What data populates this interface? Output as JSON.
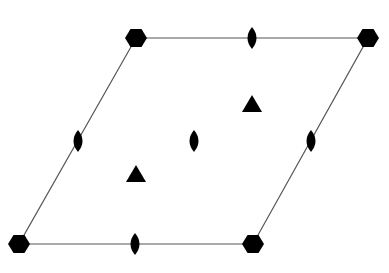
{
  "diagram": {
    "colors": {
      "background": "#ffffff",
      "edge": "#555555",
      "symbol": "#000000"
    },
    "cell": {
      "vertices": [
        [
          136,
          38
        ],
        [
          368,
          38
        ],
        [
          253,
          244
        ],
        [
          19,
          244
        ]
      ]
    },
    "sixfold_centers": [
      {
        "id": "top-left",
        "x": 136,
        "y": 38
      },
      {
        "id": "top-right",
        "x": 368,
        "y": 38
      },
      {
        "id": "bottom-right",
        "x": 253,
        "y": 244
      },
      {
        "id": "bottom-left",
        "x": 19,
        "y": 244
      }
    ],
    "threefold_centers": [
      {
        "id": "upper",
        "x": 252,
        "y": 104
      },
      {
        "id": "lower",
        "x": 136,
        "y": 174
      }
    ],
    "twofold_centers": [
      {
        "id": "top-edge",
        "x": 252,
        "y": 38
      },
      {
        "id": "bottom-edge",
        "x": 135,
        "y": 244
      },
      {
        "id": "left-edge",
        "x": 78,
        "y": 141
      },
      {
        "id": "right-edge",
        "x": 311,
        "y": 141
      },
      {
        "id": "center",
        "x": 194,
        "y": 141
      }
    ]
  }
}
